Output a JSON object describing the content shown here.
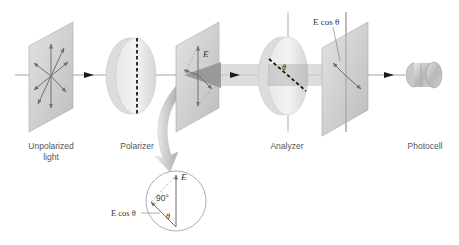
{
  "labels": {
    "unpolarized_line1": "Unpolarized",
    "unpolarized_line2": "light",
    "polarizer": "Polarizer",
    "analyzer": "Analyzer",
    "photocell": "Photocell"
  },
  "annotations": {
    "field_E": "E",
    "analyzer_output": "E cos θ",
    "analyzer_angle": "θ",
    "inset_E": "E",
    "inset_right_angle": "90°",
    "inset_component": "E cos θ",
    "inset_theta": "θ"
  },
  "colors": {
    "panel_fill": "#d4d4d4",
    "panel_edge": "#a8a8a8",
    "beam_fill": "#bdbdbd",
    "beam_dark": "#8a8a8a",
    "arrow": "#6e6e6e",
    "axis_line": "#8c8c8c",
    "dashed_axis": "#1a1a1a",
    "label_text": "#555555"
  }
}
